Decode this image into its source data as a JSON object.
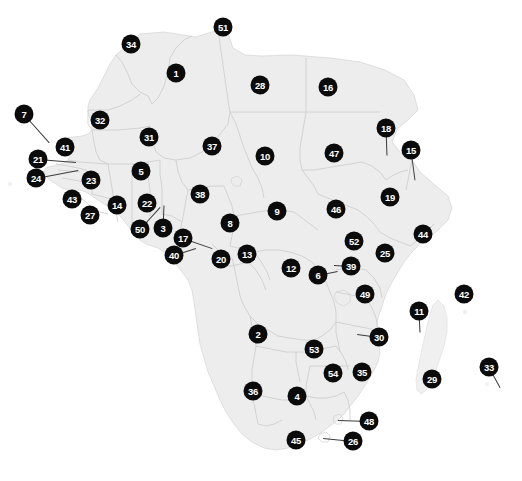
{
  "map": {
    "title": "Africa country index map",
    "region": "Africa",
    "colors": {
      "land_fill": "#ededed",
      "land_fill_alt": "#f2f2f2",
      "border_stroke": "#cfcfcf",
      "coast_stroke": "#d8d8d8",
      "marker_fill": "#0b0b0b",
      "marker_text": "#ffffff",
      "leader_line": "#3a3a3a",
      "background": "#ffffff"
    },
    "marker_count": 54,
    "markers": [
      {
        "label": "34",
        "x": 131,
        "y": 44,
        "leader": null
      },
      {
        "label": "51",
        "x": 223,
        "y": 27,
        "leader": null
      },
      {
        "label": "1",
        "x": 176,
        "y": 73,
        "leader": null
      },
      {
        "label": "28",
        "x": 260,
        "y": 85,
        "leader": null
      },
      {
        "label": "16",
        "x": 328,
        "y": 87,
        "leader": null
      },
      {
        "label": "7",
        "x": 24,
        "y": 114,
        "leader": {
          "x2": 49,
          "y2": 142
        }
      },
      {
        "label": "32",
        "x": 100,
        "y": 120,
        "leader": null
      },
      {
        "label": "31",
        "x": 149,
        "y": 137,
        "leader": null
      },
      {
        "label": "37",
        "x": 212,
        "y": 146,
        "leader": null
      },
      {
        "label": "10",
        "x": 265,
        "y": 156,
        "leader": null
      },
      {
        "label": "47",
        "x": 334,
        "y": 153,
        "leader": null
      },
      {
        "label": "18",
        "x": 386,
        "y": 128,
        "leader": {
          "x2": 387,
          "y2": 155
        }
      },
      {
        "label": "15",
        "x": 411,
        "y": 150,
        "leader": {
          "x2": 415,
          "y2": 180
        }
      },
      {
        "label": "41",
        "x": 65,
        "y": 147,
        "leader": null
      },
      {
        "label": "21",
        "x": 38,
        "y": 159,
        "leader": {
          "x2": 76,
          "y2": 162
        }
      },
      {
        "label": "24",
        "x": 36,
        "y": 178,
        "leader": {
          "x2": 78,
          "y2": 170
        }
      },
      {
        "label": "23",
        "x": 91,
        "y": 180,
        "leader": null
      },
      {
        "label": "5",
        "x": 141,
        "y": 171,
        "leader": null
      },
      {
        "label": "38",
        "x": 200,
        "y": 194,
        "leader": null
      },
      {
        "label": "19",
        "x": 390,
        "y": 197,
        "leader": null
      },
      {
        "label": "43",
        "x": 72,
        "y": 199,
        "leader": null
      },
      {
        "label": "14",
        "x": 117,
        "y": 205,
        "leader": null
      },
      {
        "label": "22",
        "x": 147,
        "y": 203,
        "leader": null
      },
      {
        "label": "27",
        "x": 90,
        "y": 215,
        "leader": null
      },
      {
        "label": "9",
        "x": 277,
        "y": 211,
        "leader": null
      },
      {
        "label": "46",
        "x": 336,
        "y": 209,
        "leader": null
      },
      {
        "label": "8",
        "x": 230,
        "y": 223,
        "leader": null
      },
      {
        "label": "50",
        "x": 140,
        "y": 229,
        "leader": {
          "x2": 160,
          "y2": 207
        }
      },
      {
        "label": "3",
        "x": 163,
        "y": 228,
        "leader": {
          "x2": 164,
          "y2": 205
        }
      },
      {
        "label": "44",
        "x": 423,
        "y": 234,
        "leader": null
      },
      {
        "label": "17",
        "x": 183,
        "y": 238,
        "leader": {
          "x2": 212,
          "y2": 248
        }
      },
      {
        "label": "52",
        "x": 354,
        "y": 241,
        "leader": null
      },
      {
        "label": "25",
        "x": 385,
        "y": 253,
        "leader": null
      },
      {
        "label": "13",
        "x": 247,
        "y": 254,
        "leader": null
      },
      {
        "label": "40",
        "x": 174,
        "y": 255,
        "leader": {
          "x2": 196,
          "y2": 248
        }
      },
      {
        "label": "20",
        "x": 221,
        "y": 259,
        "leader": null
      },
      {
        "label": "12",
        "x": 291,
        "y": 268,
        "leader": null
      },
      {
        "label": "39",
        "x": 351,
        "y": 266,
        "leader": {
          "x2": 334,
          "y2": 265
        }
      },
      {
        "label": "6",
        "x": 318,
        "y": 275,
        "leader": {
          "x2": 338,
          "y2": 271
        }
      },
      {
        "label": "49",
        "x": 365,
        "y": 294,
        "leader": null
      },
      {
        "label": "42",
        "x": 464,
        "y": 294,
        "leader": null
      },
      {
        "label": "11",
        "x": 419,
        "y": 311,
        "leader": {
          "x2": 420,
          "y2": 332
        }
      },
      {
        "label": "2",
        "x": 258,
        "y": 334,
        "leader": null
      },
      {
        "label": "30",
        "x": 379,
        "y": 337,
        "leader": {
          "x2": 357,
          "y2": 334
        }
      },
      {
        "label": "53",
        "x": 314,
        "y": 349,
        "leader": null
      },
      {
        "label": "33",
        "x": 489,
        "y": 367,
        "leader": {
          "x2": 500,
          "y2": 387
        }
      },
      {
        "label": "54",
        "x": 333,
        "y": 373,
        "leader": null
      },
      {
        "label": "35",
        "x": 362,
        "y": 372,
        "leader": null
      },
      {
        "label": "29",
        "x": 432,
        "y": 379,
        "leader": null
      },
      {
        "label": "36",
        "x": 253,
        "y": 391,
        "leader": null
      },
      {
        "label": "4",
        "x": 297,
        "y": 396,
        "leader": null
      },
      {
        "label": "48",
        "x": 369,
        "y": 421,
        "leader": {
          "x2": 338,
          "y2": 420
        }
      },
      {
        "label": "45",
        "x": 296,
        "y": 440,
        "leader": null
      },
      {
        "label": "26",
        "x": 353,
        "y": 441,
        "leader": {
          "x2": 323,
          "y2": 438
        }
      }
    ]
  }
}
